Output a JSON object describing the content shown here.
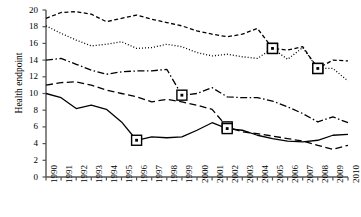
{
  "chart_data": {
    "type": "line",
    "title": "",
    "xlabel": "",
    "ylabel": "Health endpoint",
    "x": [
      1990,
      1991,
      1992,
      1993,
      1994,
      1995,
      1996,
      1997,
      1998,
      1999,
      2000,
      2001,
      2002,
      2003,
      2004,
      2005,
      2006,
      2007,
      2008,
      2009,
      2010
    ],
    "xlim": [
      1990,
      2010
    ],
    "ylim": [
      0,
      20
    ],
    "yticks": [
      0,
      2,
      4,
      6,
      8,
      10,
      12,
      14,
      16,
      18,
      20
    ],
    "xticks": [
      "1990",
      "1991",
      "1992",
      "1993",
      "1994",
      "1995",
      "1996",
      "1997",
      "1998",
      "1999",
      "2000",
      "2001",
      "2002",
      "2003",
      "2004",
      "2005",
      "2006",
      "2007",
      "2008",
      "2009",
      "2010"
    ],
    "grid": false,
    "legend": "none",
    "series": [
      {
        "name": "series-short-dash",
        "style": "short-dash",
        "color": "#000000",
        "values": [
          19.0,
          19.7,
          19.8,
          19.5,
          18.6,
          19.0,
          19.4,
          18.9,
          18.5,
          18.1,
          17.5,
          17.1,
          16.8,
          17.1,
          17.8,
          15.4,
          15.2,
          15.6,
          13.0,
          14.0,
          13.9
        ],
        "markers": [
          {
            "x": 2005,
            "y": 15.4
          },
          {
            "x": 2008,
            "y": 13.0
          }
        ]
      },
      {
        "name": "series-dotted",
        "style": "dotted",
        "color": "#000000",
        "values": [
          18.1,
          17.2,
          16.4,
          15.7,
          15.9,
          16.2,
          15.4,
          15.5,
          15.9,
          15.6,
          14.9,
          14.5,
          14.7,
          14.4,
          14.2,
          15.4,
          14.1,
          15.5,
          13.0,
          13.0,
          11.5
        ],
        "markers": [
          {
            "x": 2005,
            "y": 15.4
          },
          {
            "x": 2008,
            "y": 13.0
          }
        ]
      },
      {
        "name": "series-dash-dot",
        "style": "dash-dot",
        "color": "#000000",
        "values": [
          14.0,
          14.2,
          13.5,
          12.8,
          12.3,
          12.6,
          12.7,
          12.7,
          12.9,
          9.8,
          10.0,
          10.7,
          9.6,
          9.5,
          9.5,
          9.1,
          8.4,
          7.6,
          6.6,
          7.2,
          6.5
        ],
        "markers": [
          {
            "x": 1999,
            "y": 9.8
          }
        ]
      },
      {
        "name": "series-long-dash",
        "style": "long-dash",
        "color": "#000000",
        "values": [
          11.0,
          11.3,
          11.4,
          11.0,
          10.4,
          10.0,
          9.6,
          9.0,
          9.3,
          9.0,
          8.6,
          8.1,
          6.0,
          5.4,
          5.2,
          4.9,
          4.6,
          4.3,
          3.8,
          3.3,
          3.8
        ],
        "markers": [
          {
            "x": 2002,
            "y": 6.0
          }
        ]
      },
      {
        "name": "series-solid",
        "style": "solid",
        "color": "#000000",
        "values": [
          10.0,
          9.5,
          8.2,
          8.6,
          8.1,
          6.6,
          4.4,
          4.8,
          4.7,
          4.8,
          5.6,
          6.5,
          5.8,
          5.6,
          5.0,
          4.6,
          4.3,
          4.2,
          4.4,
          5.0,
          5.1
        ],
        "markers": [
          {
            "x": 1996,
            "y": 4.4
          },
          {
            "x": 2002,
            "y": 5.8
          }
        ]
      }
    ]
  },
  "axes": {
    "y_axis_name": "y-axis",
    "x_axis_name": "x-axis"
  }
}
